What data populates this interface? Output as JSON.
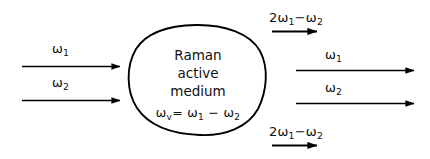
{
  "figure": {
    "type": "optical-schematic",
    "background_color": "#ffffff",
    "stroke_color": "#000000",
    "medium": {
      "name": "raman-active-medium",
      "line1": "Raman",
      "line2": "active",
      "line3": "medium",
      "formula_omega": "ω",
      "formula_sub": "v",
      "formula_rest": "= ω",
      "formula_sub1": "1",
      "formula_minus": "− ω",
      "formula_sub2": "2",
      "formula_plain": "ωv = ω1 − ω2"
    },
    "input_beams": [
      {
        "id": "input-omega-1",
        "symbol": "ω",
        "subscript": "1",
        "plain": "ω1",
        "direction": "right",
        "arrow_length": "long"
      },
      {
        "id": "input-omega-2",
        "symbol": "ω",
        "subscript": "2",
        "plain": "ω2",
        "direction": "right",
        "arrow_length": "long"
      }
    ],
    "output_beams": [
      {
        "id": "output-anti-stokes-upper",
        "prefix": "2",
        "symbol": "ω",
        "subscript": "1",
        "operator": "−",
        "symbol2": "ω",
        "subscript2": "2",
        "plain": "2ω1 − ω2",
        "direction": "right",
        "arrow_length": "short"
      },
      {
        "id": "output-omega-1",
        "symbol": "ω",
        "subscript": "1",
        "plain": "ω1",
        "direction": "right",
        "arrow_length": "long"
      },
      {
        "id": "output-omega-2",
        "symbol": "ω",
        "subscript": "2",
        "plain": "ω2",
        "direction": "right",
        "arrow_length": "long"
      },
      {
        "id": "output-anti-stokes-lower",
        "prefix": "2",
        "symbol": "ω",
        "subscript": "1",
        "operator": "−",
        "symbol2": "ω",
        "subscript2": "2",
        "plain": "2ω1 − ω2",
        "direction": "right",
        "arrow_length": "short"
      }
    ]
  }
}
